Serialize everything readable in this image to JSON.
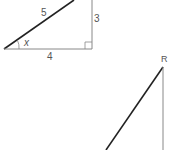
{
  "diagram": {
    "triangle_1": {
      "hypotenuse_label": "5",
      "vertical_leg_label": "3",
      "horizontal_leg_label": "4",
      "angle_label": "x",
      "right_angle_marker": true
    },
    "triangle_2": {
      "vertex_label": "R"
    },
    "colors": {
      "hypotenuse": "#222222",
      "legs": "#888888",
      "labels": "#555555",
      "background": "#ffffff"
    }
  }
}
